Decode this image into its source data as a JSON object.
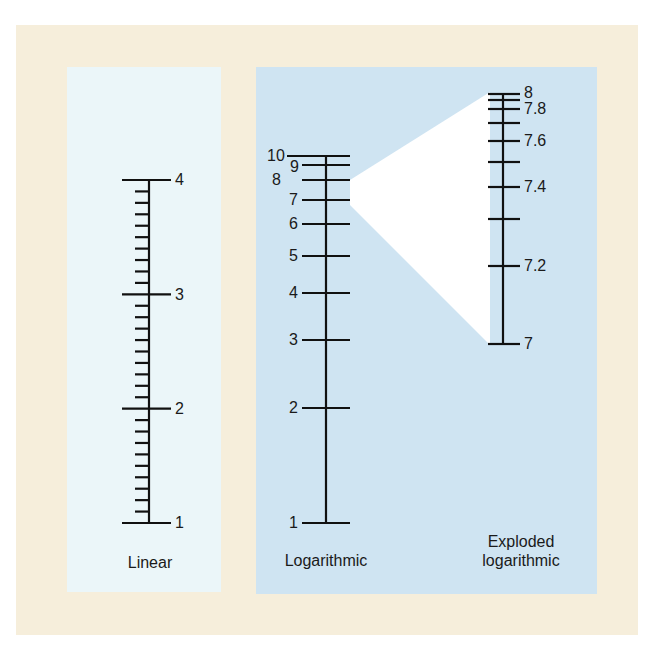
{
  "colors": {
    "frame": "#f6eedb",
    "linear_panel": "#ebf6f9",
    "log_panel": "#cfe4f2",
    "wedge": "#ffffff",
    "ink": "#111111"
  },
  "linear": {
    "caption": "Linear",
    "labels": [
      "1",
      "2",
      "3",
      "4"
    ]
  },
  "logarithmic": {
    "caption": "Logarithmic",
    "labels": [
      "1",
      "2",
      "3",
      "4",
      "5",
      "6",
      "7",
      "8",
      "9",
      "10"
    ]
  },
  "exploded": {
    "caption_line1": "Exploded",
    "caption_line2": "logarithmic",
    "labels": [
      "7",
      "7.2",
      "7.4",
      "7.6",
      "7.8",
      "8"
    ]
  },
  "chart_data": {
    "type": "diagram",
    "title": "",
    "scales": [
      {
        "name": "Linear",
        "range": [
          1,
          4
        ],
        "major_ticks": [
          1,
          2,
          3,
          4
        ],
        "minor_ticks_per_interval": 9
      },
      {
        "name": "Logarithmic",
        "range": [
          1,
          10
        ],
        "ticks": [
          1,
          2,
          3,
          4,
          5,
          6,
          7,
          8,
          9,
          10
        ],
        "labels": [
          "1",
          "2",
          "3",
          "4",
          "5",
          "6",
          "7",
          "8",
          "9",
          "10"
        ]
      },
      {
        "name": "Exploded logarithmic",
        "range": [
          7,
          8
        ],
        "ticks": [
          7,
          7.2,
          7.3,
          7.4,
          7.5,
          7.6,
          7.7,
          7.8,
          7.9,
          8
        ],
        "labels": [
          "7",
          "7.2",
          "7.4",
          "7.6",
          "7.8",
          "8"
        ],
        "zoom_of": "Logarithmic 7–8 segment"
      }
    ]
  }
}
